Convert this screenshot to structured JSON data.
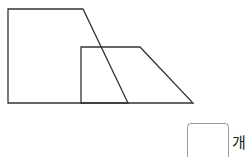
{
  "diagram": {
    "shapes": [
      {
        "name": "large-trapezoid",
        "points": [
          [
            8,
            9
          ],
          [
            83,
            9
          ],
          [
            128,
            103
          ],
          [
            8,
            103
          ]
        ]
      },
      {
        "name": "small-trapezoid",
        "points": [
          [
            81,
            47
          ],
          [
            140,
            47
          ],
          [
            193,
            103
          ],
          [
            81,
            103
          ]
        ]
      }
    ],
    "stroke_color": "#333333"
  },
  "answer": {
    "value": "",
    "unit": "개"
  }
}
